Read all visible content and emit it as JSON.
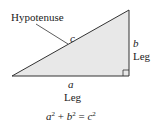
{
  "diagram": {
    "fill_color": "#e8e8e8",
    "stroke_color": "#333333",
    "labels": {
      "hypotenuse": "Hypotenuse",
      "c": "c",
      "b": "b",
      "leg_right": "Leg",
      "a": "a",
      "leg_bottom": "Leg"
    },
    "equation": {
      "a": "a",
      "a_exp": "2",
      "plus": " + ",
      "b": "b",
      "b_exp": "2",
      "equals": " = ",
      "c": "c",
      "c_exp": "2"
    }
  }
}
